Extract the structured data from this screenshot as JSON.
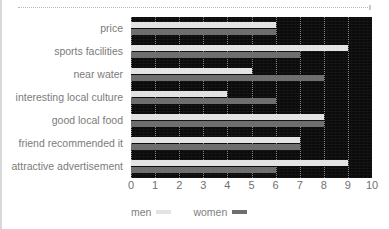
{
  "chart_data": {
    "type": "bar",
    "orientation": "horizontal",
    "title": "",
    "xlabel": "",
    "ylabel": "",
    "xlim": [
      0,
      10
    ],
    "xticks": [
      "0",
      "1",
      "2",
      "3",
      "4",
      "5",
      "6",
      "7",
      "8",
      "9",
      "10"
    ],
    "grid": true,
    "legend_position": "bottom-left",
    "categories": [
      "price",
      "sports facilities",
      "near water",
      "interesting local culture",
      "good local food",
      "friend recommended it",
      "attractive advertisement"
    ],
    "series": [
      {
        "name": "men",
        "color": "#e3e3e3",
        "values": [
          6,
          9,
          5,
          4,
          8,
          7,
          9
        ]
      },
      {
        "name": "women",
        "color": "#6e6e6e",
        "values": [
          6,
          7,
          8,
          6,
          8,
          7,
          6
        ]
      }
    ]
  },
  "legend": {
    "items": [
      {
        "label": "men",
        "color": "#e3e3e3"
      },
      {
        "label": "women",
        "color": "#6e6e6e"
      }
    ]
  },
  "style": {
    "plot_background": "#0b0b0b",
    "gridline_color": "#9a9a9a",
    "label_color": "#7b7b7b",
    "tick_color": "#6f6f6f"
  }
}
